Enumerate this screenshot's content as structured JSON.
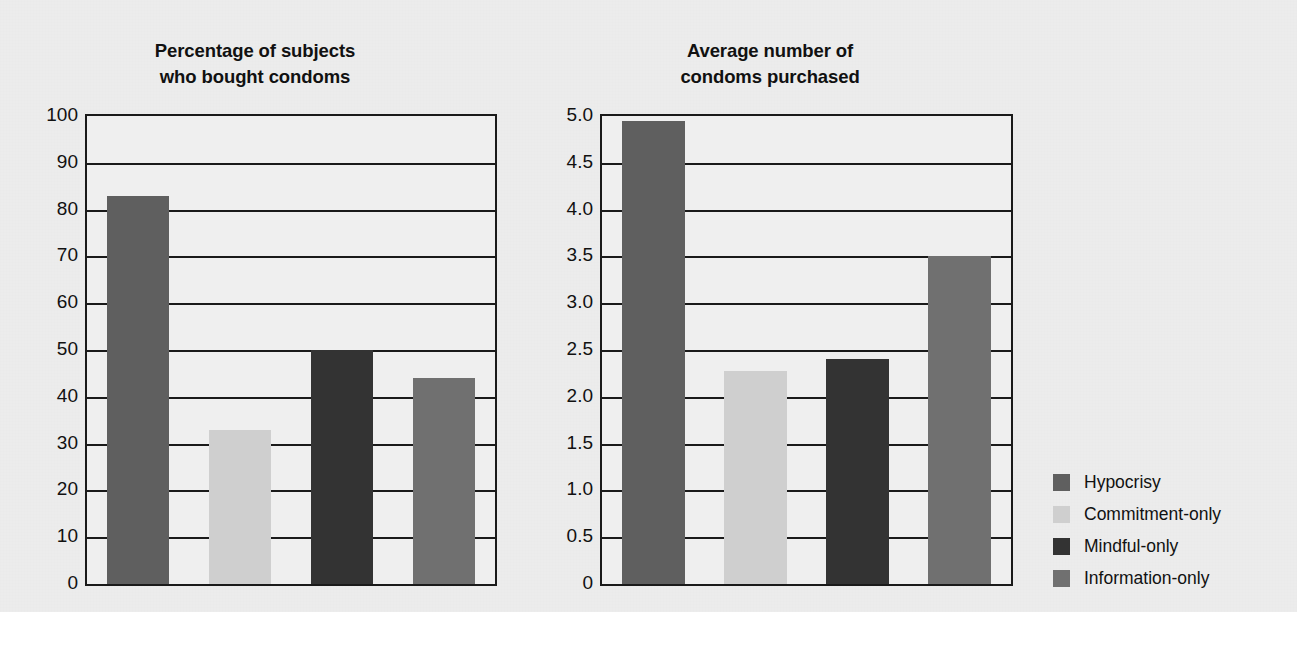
{
  "figure": {
    "background_color": "#ececec",
    "axis_color": "#1a1a1a"
  },
  "legend": {
    "position": "right",
    "entries": [
      {
        "label": "Hypocrisy",
        "color": "#5f5f5f"
      },
      {
        "label": "Commitment-only",
        "color": "#cfcfcf"
      },
      {
        "label": "Mindful-only",
        "color": "#333333"
      },
      {
        "label": "Information-only",
        "color": "#707070"
      }
    ]
  },
  "chart_data": [
    {
      "type": "bar",
      "title": "Percentage of subjects\nwho bought condoms",
      "xlabel": "",
      "ylabel": "",
      "ylim": [
        0,
        100
      ],
      "grid": true,
      "legend_position": "right",
      "categories": [
        "Hypocrisy",
        "Commitment-only",
        "Mindful-only",
        "Information-only"
      ],
      "values": [
        83,
        33,
        50,
        44
      ],
      "colors": [
        "#5f5f5f",
        "#cfcfcf",
        "#333333",
        "#707070"
      ],
      "yticks": [
        0,
        10,
        20,
        30,
        40,
        50,
        60,
        70,
        80,
        90,
        100
      ],
      "ytick_labels": [
        "0",
        "10",
        "20",
        "30",
        "40",
        "50",
        "60",
        "70",
        "80",
        "90",
        "100"
      ]
    },
    {
      "type": "bar",
      "title": "Average number of\ncondoms purchased",
      "xlabel": "",
      "ylabel": "",
      "ylim": [
        0,
        5
      ],
      "grid": true,
      "legend_position": "right",
      "categories": [
        "Hypocrisy",
        "Commitment-only",
        "Mindful-only",
        "Information-only"
      ],
      "values": [
        4.95,
        2.28,
        2.4,
        3.5
      ],
      "colors": [
        "#5f5f5f",
        "#cfcfcf",
        "#333333",
        "#707070"
      ],
      "yticks": [
        0,
        0.5,
        1.0,
        1.5,
        2.0,
        2.5,
        3.0,
        3.5,
        4.0,
        4.5,
        5.0
      ],
      "ytick_labels": [
        "0",
        "0.5",
        "1.0",
        "1.5",
        "2.0",
        "2.5",
        "3.0",
        "3.5",
        "4.0",
        "4.5",
        "5.0"
      ]
    }
  ]
}
